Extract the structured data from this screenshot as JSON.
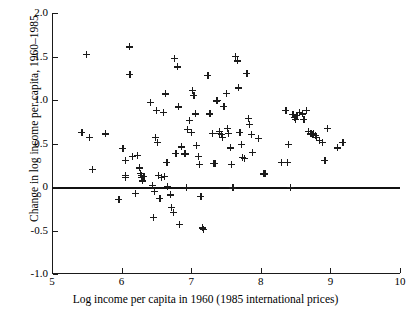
{
  "chart_data": {
    "type": "scatter",
    "title": "",
    "xlabel": "Log income per capita in 1960 (1985 international prices)",
    "ylabel": "Change in log income per capita, 1960–1985",
    "xlim": [
      5,
      10
    ],
    "ylim": [
      -1.0,
      2.0
    ],
    "grid": false,
    "legend": null,
    "xticks": [
      5,
      6,
      7,
      8,
      9,
      10
    ],
    "xticklabels": [
      "5",
      "6",
      "7",
      "8",
      "9",
      "10"
    ],
    "yticks": [
      2.0,
      1.5,
      1.0,
      0.5,
      0,
      -0.5,
      -1.0
    ],
    "yticklabels": [
      "2.0",
      "1.5",
      "1.0",
      "0.5",
      "0",
      "-0.5",
      "-1.0"
    ],
    "annotations": [
      {
        "kind": "horizontal-reference-line",
        "y": 0
      }
    ],
    "marker": "plus",
    "marker_color": "#1b1b1b",
    "n_points": 118,
    "points": [
      [
        5.43,
        0.63
      ],
      [
        5.5,
        1.52
      ],
      [
        5.54,
        0.57
      ],
      [
        5.58,
        0.2
      ],
      [
        5.77,
        0.61
      ],
      [
        5.96,
        -0.14
      ],
      [
        6.02,
        0.44
      ],
      [
        6.05,
        0.31
      ],
      [
        6.05,
        0.13
      ],
      [
        6.06,
        0.11
      ],
      [
        6.11,
        1.61
      ],
      [
        6.12,
        1.29
      ],
      [
        6.15,
        0.35
      ],
      [
        6.2,
        -0.07
      ],
      [
        6.23,
        0.36
      ],
      [
        6.26,
        0.22
      ],
      [
        6.27,
        0.16
      ],
      [
        6.28,
        0.13
      ],
      [
        6.29,
        0.11
      ],
      [
        6.3,
        0.07
      ],
      [
        6.32,
        0.12
      ],
      [
        6.41,
        0.97
      ],
      [
        6.44,
        0.02
      ],
      [
        6.46,
        -0.35
      ],
      [
        6.47,
        -0.05
      ],
      [
        6.49,
        0.57
      ],
      [
        6.5,
        0.88
      ],
      [
        6.52,
        0.51
      ],
      [
        6.53,
        0.13
      ],
      [
        6.55,
        -0.13
      ],
      [
        6.57,
        0.11
      ],
      [
        6.6,
        0.86
      ],
      [
        6.62,
        0.12
      ],
      [
        6.63,
        1.07
      ],
      [
        6.65,
        0.28
      ],
      [
        6.66,
        0.01
      ],
      [
        6.7,
        -0.09
      ],
      [
        6.72,
        -0.23
      ],
      [
        6.74,
        -0.29
      ],
      [
        6.76,
        1.48
      ],
      [
        6.78,
        0.39
      ],
      [
        6.8,
        1.38
      ],
      [
        6.82,
        0.92
      ],
      [
        6.83,
        -0.43
      ],
      [
        6.86,
        0.46
      ],
      [
        6.9,
        0.38
      ],
      [
        6.92,
        0.38
      ],
      [
        6.93,
        0.0
      ],
      [
        6.95,
        0.66
      ],
      [
        6.98,
        0.77
      ],
      [
        7.0,
        0.63
      ],
      [
        7.02,
        1.11
      ],
      [
        7.04,
        1.05
      ],
      [
        7.06,
        0.84
      ],
      [
        7.08,
        0.48
      ],
      [
        7.1,
        0.35
      ],
      [
        7.12,
        0.26
      ],
      [
        7.14,
        -0.11
      ],
      [
        7.16,
        -0.47
      ],
      [
        7.18,
        -0.49
      ],
      [
        7.24,
        1.28
      ],
      [
        7.27,
        0.84
      ],
      [
        7.3,
        0.62
      ],
      [
        7.32,
        0.27
      ],
      [
        7.34,
        0.27
      ],
      [
        7.36,
        0.99
      ],
      [
        7.38,
        1.0
      ],
      [
        7.4,
        0.64
      ],
      [
        7.41,
        0.62
      ],
      [
        7.43,
        0.6
      ],
      [
        7.45,
        0.57
      ],
      [
        7.47,
        0.93
      ],
      [
        7.5,
        1.08
      ],
      [
        7.52,
        0.67
      ],
      [
        7.54,
        0.62
      ],
      [
        7.56,
        0.45
      ],
      [
        7.58,
        0.26
      ],
      [
        7.6,
        -0.01
      ],
      [
        7.64,
        1.5
      ],
      [
        7.66,
        1.45
      ],
      [
        7.68,
        1.14
      ],
      [
        7.7,
        0.63
      ],
      [
        7.72,
        0.49
      ],
      [
        7.74,
        0.34
      ],
      [
        7.76,
        0.33
      ],
      [
        7.8,
        1.31
      ],
      [
        7.82,
        0.79
      ],
      [
        7.84,
        0.72
      ],
      [
        7.86,
        0.6
      ],
      [
        7.88,
        0.4
      ],
      [
        7.96,
        0.56
      ],
      [
        8.04,
        0.15
      ],
      [
        8.06,
        0.15
      ],
      [
        8.36,
        0.88
      ],
      [
        8.38,
        0.28
      ],
      [
        8.4,
        0.49
      ],
      [
        8.42,
        0.0
      ],
      [
        8.46,
        0.83
      ],
      [
        8.48,
        0.8
      ],
      [
        8.5,
        0.78
      ],
      [
        8.52,
        0.82
      ],
      [
        8.56,
        0.86
      ],
      [
        8.6,
        0.84
      ],
      [
        8.62,
        0.78
      ],
      [
        8.66,
        0.88
      ],
      [
        8.68,
        0.64
      ],
      [
        8.72,
        0.61
      ],
      [
        8.74,
        0.6
      ],
      [
        8.76,
        0.62
      ],
      [
        8.78,
        0.59
      ],
      [
        8.8,
        0.57
      ],
      [
        8.84,
        0.54
      ],
      [
        8.88,
        0.51
      ],
      [
        8.92,
        0.31
      ],
      [
        8.96,
        0.67
      ],
      [
        9.1,
        0.45
      ],
      [
        9.18,
        0.51
      ],
      [
        8.3,
        0.28
      ]
    ]
  }
}
